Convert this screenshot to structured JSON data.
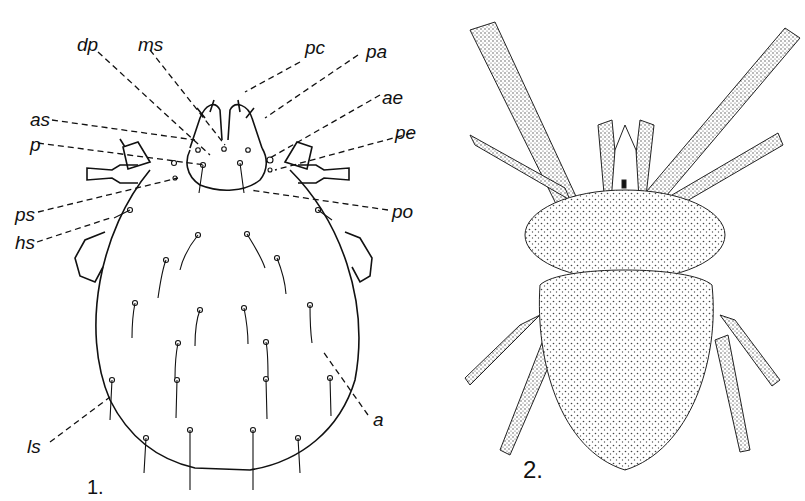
{
  "figure1": {
    "number": "1.",
    "labels": {
      "dp": "dp",
      "ms": "ms",
      "pc": "pc",
      "pa": "pa",
      "ae": "ae",
      "as": "as",
      "p": "p",
      "pe": "pe",
      "ps": "ps",
      "hs": "hs",
      "po": "po",
      "ls": "ls",
      "a": "a"
    }
  },
  "figure2": {
    "number": "2."
  },
  "colors": {
    "ink": "#111111",
    "stipple": "#444444",
    "background": "#ffffff"
  }
}
